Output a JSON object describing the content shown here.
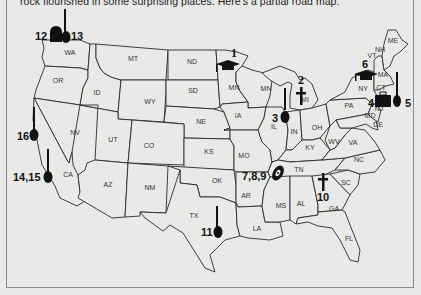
{
  "caption": "rock flourished in some surprising places. Here's a partial road map.",
  "states": [
    {
      "abbr": "WA",
      "x": 70,
      "y": 55
    },
    {
      "abbr": "OR",
      "x": 58,
      "y": 83
    },
    {
      "abbr": "ID",
      "x": 97,
      "y": 95
    },
    {
      "abbr": "MT",
      "x": 133,
      "y": 61
    },
    {
      "abbr": "WY",
      "x": 150,
      "y": 104
    },
    {
      "abbr": "ND",
      "x": 192,
      "y": 64
    },
    {
      "abbr": "SD",
      "x": 193,
      "y": 93
    },
    {
      "abbr": "NE",
      "x": 201,
      "y": 124
    },
    {
      "abbr": "NV",
      "x": 75,
      "y": 135
    },
    {
      "abbr": "UT",
      "x": 113,
      "y": 142
    },
    {
      "abbr": "CO",
      "x": 149,
      "y": 148
    },
    {
      "abbr": "KS",
      "x": 209,
      "y": 154
    },
    {
      "abbr": "CA",
      "x": 68,
      "y": 177
    },
    {
      "abbr": "AZ",
      "x": 108,
      "y": 187
    },
    {
      "abbr": "NM",
      "x": 150,
      "y": 190
    },
    {
      "abbr": "OK",
      "x": 217,
      "y": 183
    },
    {
      "abbr": "TX",
      "x": 194,
      "y": 218
    },
    {
      "abbr": "MN",
      "x": 234,
      "y": 90
    },
    {
      "abbr": "MN",
      "x": 266,
      "y": 91
    },
    {
      "abbr": "IA",
      "x": 238,
      "y": 118
    },
    {
      "abbr": "MO",
      "x": 244,
      "y": 158
    },
    {
      "abbr": "AR",
      "x": 246,
      "y": 198
    },
    {
      "abbr": "LA",
      "x": 257,
      "y": 231
    },
    {
      "abbr": "IL",
      "x": 274,
      "y": 129
    },
    {
      "abbr": "IN",
      "x": 294,
      "y": 134
    },
    {
      "abbr": "OH",
      "x": 317,
      "y": 130
    },
    {
      "abbr": "KY",
      "x": 310,
      "y": 150
    },
    {
      "abbr": "TN",
      "x": 299,
      "y": 172
    },
    {
      "abbr": "MS",
      "x": 281,
      "y": 208
    },
    {
      "abbr": "AL",
      "x": 301,
      "y": 206
    },
    {
      "abbr": "GA",
      "x": 334,
      "y": 211
    },
    {
      "abbr": "FL",
      "x": 349,
      "y": 241
    },
    {
      "abbr": "SC",
      "x": 346,
      "y": 185
    },
    {
      "abbr": "NC",
      "x": 359,
      "y": 162
    },
    {
      "abbr": "VA",
      "x": 353,
      "y": 145
    },
    {
      "abbr": "WV",
      "x": 334,
      "y": 144
    },
    {
      "abbr": "MI",
      "x": 305,
      "y": 102
    },
    {
      "abbr": "PA",
      "x": 349,
      "y": 108
    },
    {
      "abbr": "NY",
      "x": 363,
      "y": 91
    },
    {
      "abbr": "MD",
      "x": 370,
      "y": 118
    },
    {
      "abbr": "NJ",
      "x": 379,
      "y": 111
    },
    {
      "abbr": "DE",
      "x": 378,
      "y": 127
    },
    {
      "abbr": "MA",
      "x": 383,
      "y": 77
    },
    {
      "abbr": "CT",
      "x": 381,
      "y": 90
    },
    {
      "abbr": "VT",
      "x": 372,
      "y": 58
    },
    {
      "abbr": "NH",
      "x": 380,
      "y": 52
    },
    {
      "abbr": "ME",
      "x": 393,
      "y": 43
    }
  ],
  "markers": [
    {
      "id": "1",
      "label": "1",
      "icon": "graduation-cap",
      "state": "MN"
    },
    {
      "id": "2",
      "label": "2",
      "icon": "cross",
      "state": "MI"
    },
    {
      "id": "3",
      "label": "3",
      "icon": "guitar",
      "state": "IL"
    },
    {
      "id": "4",
      "label": "4",
      "icon": "briefcase",
      "state": "MA"
    },
    {
      "id": "5",
      "label": "5",
      "icon": "guitar",
      "state": "MA"
    },
    {
      "id": "6",
      "label": "6",
      "icon": "graduation-cap",
      "state": "NY"
    },
    {
      "id": "7-9",
      "label": "7,8,9",
      "icon": "vinyl-record",
      "state": "TN"
    },
    {
      "id": "10",
      "label": "10",
      "icon": "cross",
      "state": "GA"
    },
    {
      "id": "11",
      "label": "11",
      "icon": "guitar",
      "state": "TX"
    },
    {
      "id": "12",
      "label": "12",
      "icon": "tombstone",
      "state": "WA"
    },
    {
      "id": "13",
      "label": "13",
      "icon": "guitar",
      "state": "WA"
    },
    {
      "id": "14-15",
      "label": "14,15",
      "icon": "guitar",
      "state": "CA"
    },
    {
      "id": "16",
      "label": "16",
      "icon": "guitar",
      "state": "CA"
    }
  ]
}
